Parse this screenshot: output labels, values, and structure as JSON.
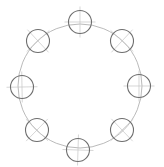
{
  "drawing": {
    "type": "bolt-circle",
    "hole_count": 8,
    "pitch_circle": {
      "cx": 80,
      "cy": 86,
      "r": 62
    },
    "hole_radius": 11.5,
    "colors": {
      "background": "#ffffff",
      "hole_stroke": "#6e6e6e",
      "pitch_stroke": "#a8a8a8",
      "centerline_stroke": "#c4c4c4"
    },
    "holes": [
      {
        "id": "hole-top",
        "cx": 80,
        "cy": 22
      },
      {
        "id": "hole-top-right",
        "cx": 122,
        "cy": 41
      },
      {
        "id": "hole-right",
        "cx": 139,
        "cy": 86
      },
      {
        "id": "hole-bottom-right",
        "cx": 122,
        "cy": 130
      },
      {
        "id": "hole-bottom",
        "cx": 78,
        "cy": 150
      },
      {
        "id": "hole-bottom-left",
        "cx": 37,
        "cy": 130
      },
      {
        "id": "hole-left",
        "cx": 22,
        "cy": 87
      },
      {
        "id": "hole-top-left",
        "cx": 38,
        "cy": 41
      }
    ]
  }
}
